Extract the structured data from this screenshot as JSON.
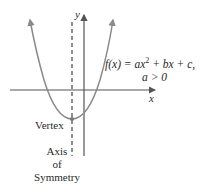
{
  "diagram": {
    "equation_line1_prefix": "f(x) = ax",
    "equation_exponent": "2",
    "equation_line1_suffix": " + bx + c,",
    "equation_line2": "a > 0",
    "x_axis_label": "x",
    "y_axis_label": "y",
    "vertex_label": "Vertex",
    "axis_of_symmetry_label": [
      "Axis",
      "of",
      "Symmetry"
    ],
    "colors": {
      "curve": "#8a8a8a",
      "axes": "#555555",
      "text": "#2a2a2a"
    }
  }
}
